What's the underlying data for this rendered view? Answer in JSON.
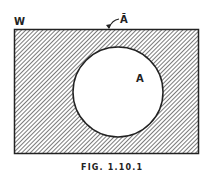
{
  "diagram": {
    "type": "venn",
    "universe_label": "W",
    "set_label": "A",
    "complement_label": "Ā",
    "caption": "FIG. 1.10.1",
    "shaded_region": "complement of A in W",
    "colors": {
      "ink": "#222222",
      "background": "#ffffff"
    }
  }
}
